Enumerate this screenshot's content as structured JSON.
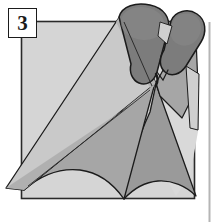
{
  "figure": {
    "step_label": "3",
    "caption": "",
    "background_color": "#ffffff",
    "panel_color": "#d5d5d5",
    "outline_color": "#1b1b1b",
    "divider_color": "#b5b5b5"
  },
  "palette": {
    "panel_fill": "#d5d5d5",
    "panel_border": "#2a2a2a",
    "cloth_light": "#c9c9c9",
    "cloth_lighter": "#d9d9d9",
    "cloth_mid": "#a6a6a6",
    "cloth_mid_dark": "#9a9a9a",
    "cloth_dark": "#8a8a8a",
    "roll_dark": "#7c7c7c",
    "roll_darker": "#6f6f6f",
    "line": "#1b1b1b",
    "mark": "#1b1b1b"
  },
  "shapes": {
    "panel": {
      "name": "grey-square-panel",
      "x": 21,
      "y": 21,
      "width": 174,
      "height": 178
    },
    "divider": {
      "name": "right-page-divider",
      "x": 209,
      "y1": 22,
      "y2": 222
    },
    "roll_left": {
      "name": "left-rolled-cone-top"
    },
    "roll_right": {
      "name": "right-rolled-cone-top"
    },
    "cone_body": {
      "name": "cone-body"
    },
    "cloth_drape": {
      "name": "draped-cloth-panel"
    },
    "stitch_mark": {
      "name": "stitch-mark",
      "x": 156,
      "y": 79
    }
  }
}
